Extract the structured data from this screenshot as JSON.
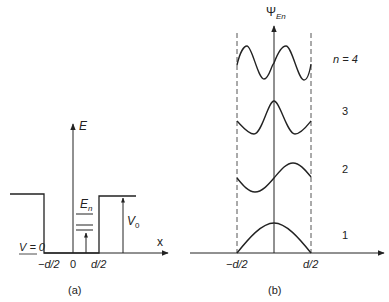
{
  "panel_a": {
    "caption": "(a)",
    "y_axis_label": "E",
    "x_axis_label": "x",
    "energy_label": "E",
    "energy_label_sub": "n",
    "barrier_label": "V",
    "barrier_label_sub": "0",
    "zero_potential_label": "V = 0",
    "x_ticks": [
      "−d/2",
      "0",
      "d/2"
    ]
  },
  "panel_b": {
    "caption": "(b)",
    "y_axis_label": "Ψ",
    "y_axis_label_sub": "En",
    "x_ticks": [
      "−d/2",
      "d/2"
    ],
    "state_labels": [
      "n = 4",
      "3",
      "2",
      "1"
    ]
  },
  "colors": {
    "stroke": "#222222",
    "dashed": "#555555",
    "background": "#ffffff"
  }
}
